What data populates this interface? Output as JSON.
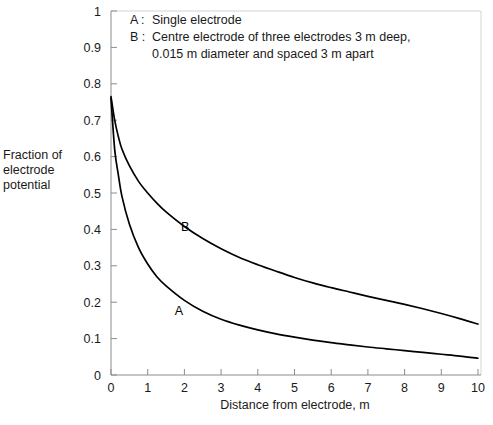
{
  "chart_data": {
    "type": "line",
    "title": "",
    "xlabel": "Distance from electrode, m",
    "ylabel": "Fraction of electrode potential",
    "ylabel_lines": [
      "Fraction of",
      "electrode",
      "potential"
    ],
    "xlim": [
      0,
      10
    ],
    "ylim": [
      0,
      1
    ],
    "xticks": [
      "0",
      "1",
      "2",
      "3",
      "4",
      "5",
      "6",
      "7",
      "8",
      "9",
      "10"
    ],
    "yticks": [
      "0",
      "0.1",
      "0.2",
      "0.3",
      "0.4",
      "0.5",
      "0.6",
      "0.7",
      "0.8",
      "0.9",
      "1"
    ],
    "grid": false,
    "legend_position": "inside-top-left",
    "line_color": "#000000",
    "axis_color": "#8c8c8c",
    "background": "#ffffff",
    "x": [
      0,
      0.1,
      0.2,
      0.3,
      0.5,
      0.75,
      1,
      1.25,
      1.5,
      2,
      2.5,
      3,
      3.5,
      4,
      4.5,
      5,
      5.5,
      6,
      6.5,
      7,
      7.5,
      8,
      8.5,
      9,
      9.5,
      10
    ],
    "series": [
      {
        "name": "A",
        "label": "A",
        "description": "Single electrode",
        "label_x": 1.85,
        "label_y": 0.165,
        "values": [
          0.76,
          0.62,
          0.55,
          0.49,
          0.415,
          0.35,
          0.305,
          0.27,
          0.245,
          0.205,
          0.175,
          0.153,
          0.137,
          0.124,
          0.113,
          0.104,
          0.096,
          0.089,
          0.083,
          0.077,
          0.072,
          0.067,
          0.062,
          0.057,
          0.052,
          0.046
        ]
      },
      {
        "name": "B",
        "label": "B",
        "description": "Centre electrode of three electrodes 3 m deep, 0.015 m diameter and spaced 3 m apart",
        "label_x": 2.02,
        "label_y": 0.395,
        "values": [
          0.765,
          0.7,
          0.655,
          0.62,
          0.575,
          0.532,
          0.5,
          0.472,
          0.448,
          0.408,
          0.375,
          0.347,
          0.323,
          0.303,
          0.285,
          0.268,
          0.253,
          0.24,
          0.228,
          0.216,
          0.205,
          0.194,
          0.182,
          0.169,
          0.155,
          0.14
        ]
      }
    ]
  },
  "legend": {
    "items": [
      {
        "key": "A :",
        "text": "Single electrode",
        "text2": ""
      },
      {
        "key": "B :",
        "text": "Centre electrode of three electrodes 3 m deep,",
        "text2": "0.015 m diameter and spaced 3 m apart"
      }
    ]
  }
}
